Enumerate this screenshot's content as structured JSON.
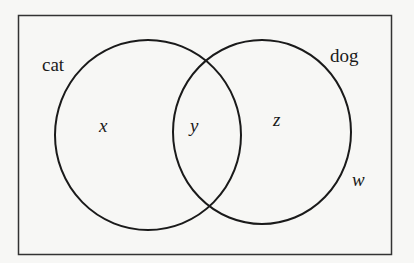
{
  "diagram": {
    "type": "venn",
    "sets": [
      {
        "name": "cat",
        "label": "cat"
      },
      {
        "name": "dog",
        "label": "dog"
      }
    ],
    "regions": {
      "cat_only": "x",
      "intersection": "y",
      "dog_only": "z",
      "outside": "w"
    },
    "colors": {
      "stroke": "#1a1a1a",
      "background": "#f7f7f5"
    }
  }
}
